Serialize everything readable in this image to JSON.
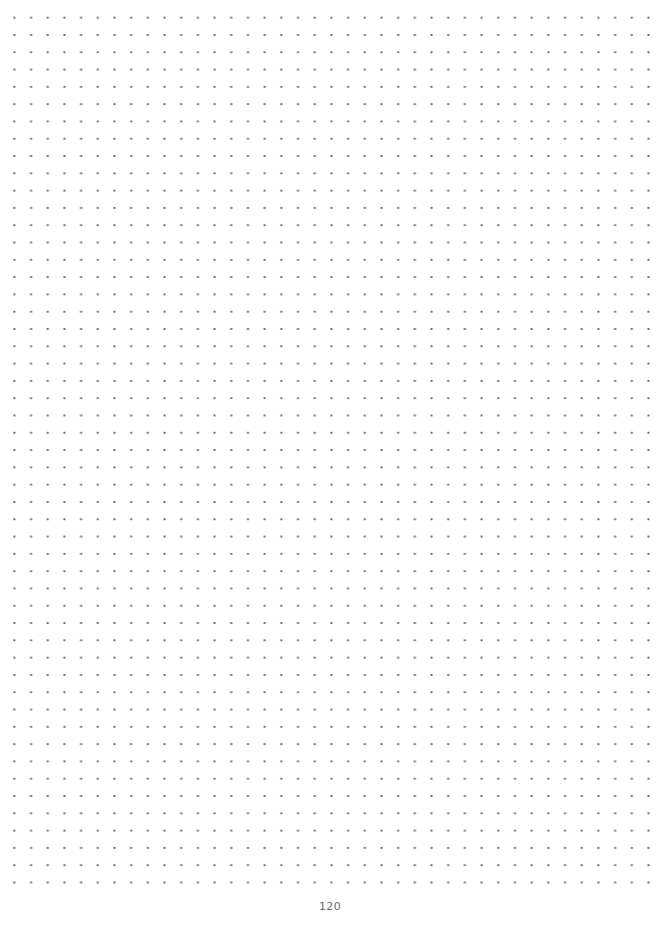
{
  "page": {
    "type": "dot-grid-notebook-page",
    "background_color": "#ffffff",
    "dot_color": "#6a6a6a",
    "grid": {
      "columns": 39,
      "rows": 51,
      "spacing_x_px": 16.7,
      "spacing_y_px": 17.3
    },
    "page_number": "120"
  }
}
